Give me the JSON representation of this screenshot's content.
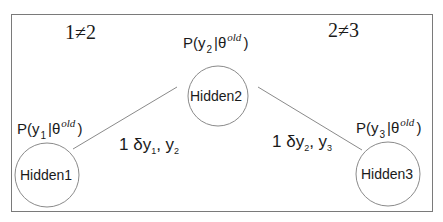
{
  "diagram": {
    "constraints": {
      "left": "1≠2",
      "right": "2≠3"
    },
    "nodes": [
      {
        "id": "hidden1",
        "label": "Hidden1",
        "prob": {
          "prefix": "P(y",
          "sub": "1",
          "mid": "|θ",
          "sup": "old",
          "suffix": ")"
        }
      },
      {
        "id": "hidden2",
        "label": "Hidden2",
        "prob": {
          "prefix": "P(y",
          "sub": "2",
          "mid": "|θ",
          "sup": "old",
          "suffix": ")"
        }
      },
      {
        "id": "hidden3",
        "label": "Hidden3",
        "prob": {
          "prefix": "P(y",
          "sub": "3",
          "mid": "|θ",
          "sup": "old",
          "suffix": ")"
        }
      }
    ],
    "edges": [
      {
        "from": "hidden1",
        "to": "hidden2",
        "label": {
          "prefix": "1 δy",
          "sub1": "1",
          "mid": ", y",
          "sub2": "2"
        }
      },
      {
        "from": "hidden2",
        "to": "hidden3",
        "label": {
          "prefix": "1 δy",
          "sub1": "2",
          "mid": ", y",
          "sub2": "3"
        }
      }
    ],
    "colors": {
      "stroke": "#8a8a8a",
      "frame": "#7a7a7a",
      "text": "#1a1a1a"
    }
  }
}
